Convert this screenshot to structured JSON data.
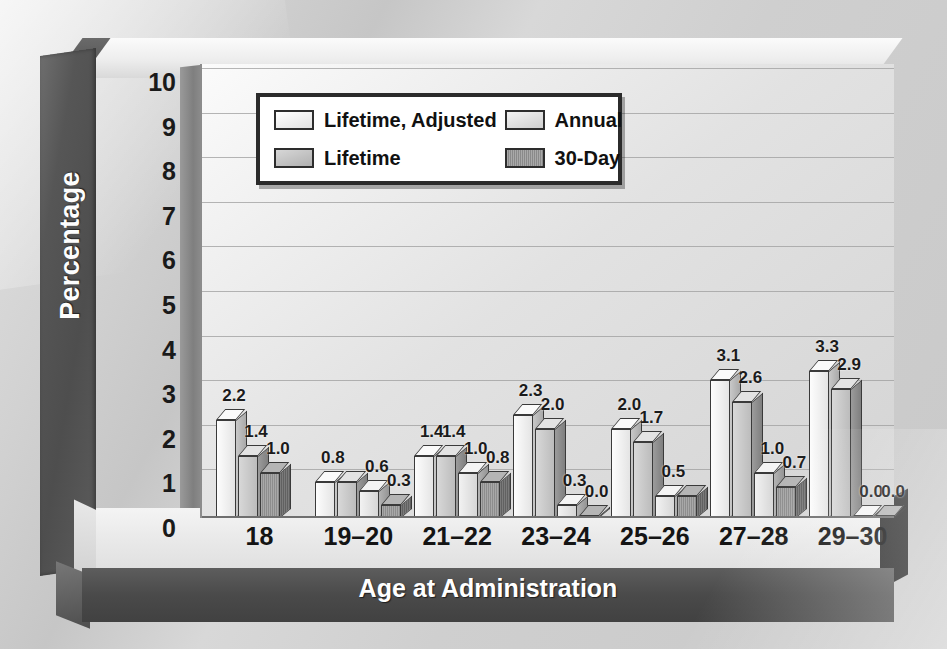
{
  "chart_data": {
    "type": "bar",
    "title": "",
    "xlabel": "Age at Administration",
    "ylabel": "Percentage",
    "categories": [
      "18",
      "19–20",
      "21–22",
      "23–24",
      "25–26",
      "27–28",
      "29–30"
    ],
    "ylim": [
      0,
      10
    ],
    "yticks": [
      "10",
      "9",
      "8",
      "7",
      "6",
      "5",
      "4",
      "3",
      "2",
      "1",
      "0"
    ],
    "grid": true,
    "legend_position": "top-left-inside",
    "style": "3d-grayscale-bars-with-data-labels",
    "series": [
      {
        "name": "Lifetime, Adjusted",
        "values": [
          2.2,
          0.8,
          1.4,
          2.3,
          2.0,
          3.1,
          3.3
        ]
      },
      {
        "name": "Lifetime",
        "values": [
          2.2,
          0.8,
          1.4,
          2.3,
          2.0,
          3.1,
          3.3
        ]
      },
      {
        "name": "Annual",
        "values": [
          1.4,
          0.6,
          1.0,
          0.3,
          0.5,
          1.0,
          0.0
        ]
      },
      {
        "name": "30-Day",
        "values": [
          1.0,
          0.3,
          0.8,
          0.0,
          0.5,
          0.7,
          0.0
        ]
      }
    ],
    "data_labels": {
      "18": [
        "2.2",
        "1.4",
        "1.0"
      ],
      "19–20": [
        "0.8",
        "0.6",
        "0.3"
      ],
      "21–22": [
        "1.4",
        "1.4",
        "1.0",
        "0.8"
      ],
      "23–24": [
        "2.3",
        "2.0",
        "0.3",
        "0.0"
      ],
      "25–26": [
        "2.0",
        "1.7",
        "0.5"
      ],
      "27–28": [
        "3.1",
        "2.6",
        "1.0",
        "0.7"
      ],
      "29–30": [
        "3.3",
        "2.9",
        "0.0",
        "0.0"
      ]
    },
    "groups": [
      {
        "category": "18",
        "bars": [
          {
            "value": 2.2,
            "label": "2.2",
            "series": 0
          },
          {
            "value": 1.4,
            "label": "1.4",
            "series": 1
          },
          {
            "value": 1.0,
            "label": "1.0",
            "series": 3
          }
        ]
      },
      {
        "category": "19–20",
        "bars": [
          {
            "value": 0.8,
            "label": "0.8",
            "series": 0
          },
          {
            "value": 0.8,
            "label": "",
            "series": 1
          },
          {
            "value": 0.6,
            "label": "0.6",
            "series": 2
          },
          {
            "value": 0.3,
            "label": "0.3",
            "series": 3
          }
        ]
      },
      {
        "category": "21–22",
        "bars": [
          {
            "value": 1.4,
            "label": "1.4",
            "series": 0
          },
          {
            "value": 1.4,
            "label": "1.4",
            "series": 1
          },
          {
            "value": 1.0,
            "label": "1.0",
            "series": 2
          },
          {
            "value": 0.8,
            "label": "0.8",
            "series": 3
          }
        ]
      },
      {
        "category": "23–24",
        "bars": [
          {
            "value": 2.3,
            "label": "2.3",
            "series": 0
          },
          {
            "value": 2.0,
            "label": "2.0",
            "series": 1
          },
          {
            "value": 0.3,
            "label": "0.3",
            "series": 2
          },
          {
            "value": 0.0,
            "label": "0.0",
            "series": 3
          }
        ]
      },
      {
        "category": "25–26",
        "bars": [
          {
            "value": 2.0,
            "label": "2.0",
            "series": 0
          },
          {
            "value": 1.7,
            "label": "1.7",
            "series": 1
          },
          {
            "value": 0.5,
            "label": "0.5",
            "series": 2
          },
          {
            "value": 0.5,
            "label": "",
            "series": 3
          }
        ]
      },
      {
        "category": "27–28",
        "bars": [
          {
            "value": 3.1,
            "label": "3.1",
            "series": 0
          },
          {
            "value": 2.6,
            "label": "2.6",
            "series": 1
          },
          {
            "value": 1.0,
            "label": "1.0",
            "series": 2
          },
          {
            "value": 0.7,
            "label": "0.7",
            "series": 3
          }
        ]
      },
      {
        "category": "29–30",
        "bars": [
          {
            "value": 3.3,
            "label": "3.3",
            "series": 0
          },
          {
            "value": 2.9,
            "label": "2.9",
            "series": 1
          },
          {
            "value": 0.0,
            "label": "0.0",
            "series": 2
          },
          {
            "value": 0.0,
            "label": "0.0",
            "series": 3
          }
        ]
      }
    ]
  },
  "legend": {
    "entries": [
      {
        "label": "Lifetime, Adjusted",
        "swatch": "swatch-lifetime-adjusted"
      },
      {
        "label": "Annual",
        "swatch": "swatch-annual"
      },
      {
        "label": "Lifetime",
        "swatch": "swatch-lifetime"
      },
      {
        "label": "30-Day",
        "swatch": "swatch-30-day"
      }
    ]
  },
  "colors": {
    "axis_text": "#1a1a1a",
    "axis_title_text": "#ffffff",
    "base_band": "#4a4a4a",
    "plot_bg": "#e6e6e6",
    "grid": "#9e9e9e",
    "legend_border": "#2b2b2b"
  }
}
